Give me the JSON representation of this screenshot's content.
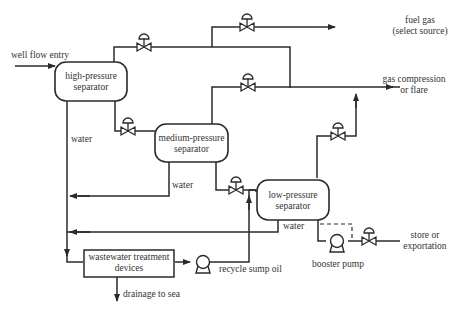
{
  "diagram": {
    "type": "process-flow",
    "colors": {
      "line": "#2a2a2a",
      "text": "#333333",
      "background": "#ffffff"
    },
    "nodes": {
      "high_pressure_separator": {
        "line1": "high-pressure",
        "line2": "separator"
      },
      "medium_pressure_separator": {
        "line1": "medium-pressure",
        "line2": "separator"
      },
      "low_pressure_separator": {
        "line1": "low-pressure",
        "line2": "separator"
      },
      "wastewater_treatment": {
        "line1": "wastewater treatment",
        "line2": "devices"
      }
    },
    "labels": {
      "well_flow_entry": "well flow entry",
      "fuel_gas_1": "fuel gas",
      "fuel_gas_2": "(select source)",
      "gas_compression_1": "gas compression",
      "gas_compression_2": "or flare",
      "water_hp": "water",
      "water_mp": "water",
      "water_lp": "water",
      "drainage": "drainage to sea",
      "recycle": "recycle sump oil",
      "booster_pump": "booster pump",
      "store_1": "store or",
      "store_2": "exportation"
    },
    "icons": {
      "valve": "control-valve-icon",
      "pump": "pump-icon",
      "arrow": "flow-arrow-icon"
    },
    "edges": [
      {
        "from": "well flow entry",
        "to": "high-pressure separator"
      },
      {
        "from": "high-pressure separator",
        "to": "fuel gas (select source)",
        "via": "control valve"
      },
      {
        "from": "high-pressure separator",
        "to": "gas compression or flare"
      },
      {
        "from": "high-pressure separator",
        "to": "medium-pressure separator",
        "via": "control valve"
      },
      {
        "from": "high-pressure separator",
        "to": "wastewater treatment devices",
        "label": "water"
      },
      {
        "from": "medium-pressure separator",
        "to": "gas compression or flare",
        "via": "control valve"
      },
      {
        "from": "medium-pressure separator",
        "to": "low-pressure separator",
        "via": "control valve"
      },
      {
        "from": "medium-pressure separator",
        "to": "wastewater treatment devices",
        "label": "water"
      },
      {
        "from": "low-pressure separator",
        "to": "gas compression or flare",
        "via": "control valve"
      },
      {
        "from": "low-pressure separator",
        "to": "wastewater treatment devices",
        "label": "water"
      },
      {
        "from": "low-pressure separator",
        "to": "store or exportation",
        "via": "booster pump, control valve"
      },
      {
        "from": "wastewater treatment devices",
        "to": "drainage to sea"
      },
      {
        "from": "wastewater treatment devices",
        "to": "low-pressure separator",
        "label": "recycle sump oil",
        "via": "pump"
      }
    ]
  }
}
